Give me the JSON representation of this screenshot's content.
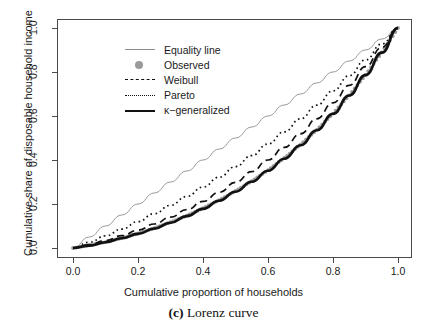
{
  "figure": {
    "caption_prefix": "(c)",
    "caption_text": "Lorenz curve"
  },
  "axes": {
    "x_title": "Cumulative proportion of households",
    "y_title": "Cumulative share of disposable household income",
    "x_ticks": [
      "0.0",
      "0.2",
      "0.4",
      "0.6",
      "0.8",
      "1.0"
    ],
    "y_ticks": [
      "0.0",
      "0.2",
      "0.4",
      "0.6",
      "0.8",
      "1.0"
    ]
  },
  "legend": {
    "items": [
      {
        "label": "Equality line",
        "key": "solid-thin-line",
        "color": "#8c8c8c"
      },
      {
        "label": "Observed",
        "key": "filled-circle-point",
        "color": "#9a9a9a"
      },
      {
        "label": "Weibull",
        "key": "dashed-line",
        "color": "#111111"
      },
      {
        "label": "Pareto",
        "key": "dotted-line",
        "color": "#111111"
      },
      {
        "label": "κ−generalized",
        "key": "solid-thick-line",
        "color": "#111111"
      }
    ]
  },
  "chart_data": {
    "type": "line",
    "title": "",
    "xlabel": "Cumulative proportion of households",
    "ylabel": "Cumulative share of disposable household income",
    "xlim": [
      0.0,
      1.0
    ],
    "ylim": [
      0.0,
      1.0
    ],
    "xticks": [
      0.0,
      0.2,
      0.4,
      0.6,
      0.8,
      1.0
    ],
    "yticks": [
      0.0,
      0.2,
      0.4,
      0.6,
      0.8,
      1.0
    ],
    "grid": false,
    "legend_position": "top-left",
    "x": [
      0.0,
      0.05,
      0.1,
      0.15,
      0.2,
      0.25,
      0.3,
      0.35,
      0.4,
      0.45,
      0.5,
      0.55,
      0.6,
      0.65,
      0.7,
      0.75,
      0.8,
      0.85,
      0.9,
      0.95,
      1.0
    ],
    "series": [
      {
        "name": "Equality line",
        "style": "solid-thin",
        "color": "#8c8c8c",
        "values": [
          0.0,
          0.05,
          0.1,
          0.15,
          0.2,
          0.25,
          0.3,
          0.35,
          0.4,
          0.45,
          0.5,
          0.55,
          0.6,
          0.65,
          0.7,
          0.75,
          0.8,
          0.85,
          0.9,
          0.95,
          1.0
        ]
      },
      {
        "name": "Observed",
        "style": "points",
        "color": "#9a9a9a",
        "values": [
          0.0,
          0.012,
          0.027,
          0.045,
          0.066,
          0.09,
          0.117,
          0.147,
          0.181,
          0.218,
          0.259,
          0.304,
          0.354,
          0.409,
          0.47,
          0.537,
          0.611,
          0.694,
          0.787,
          0.889,
          1.0
        ]
      },
      {
        "name": "Weibull",
        "style": "dashed",
        "color": "#111111",
        "values": [
          0.0,
          0.015,
          0.034,
          0.056,
          0.081,
          0.109,
          0.14,
          0.174,
          0.212,
          0.253,
          0.298,
          0.347,
          0.4,
          0.457,
          0.519,
          0.587,
          0.66,
          0.739,
          0.824,
          0.912,
          1.0
        ]
      },
      {
        "name": "Pareto",
        "style": "dotted",
        "color": "#111111",
        "values": [
          0.0,
          0.026,
          0.055,
          0.086,
          0.12,
          0.156,
          0.194,
          0.234,
          0.277,
          0.322,
          0.37,
          0.42,
          0.473,
          0.528,
          0.587,
          0.649,
          0.714,
          0.783,
          0.855,
          0.927,
          1.0
        ]
      },
      {
        "name": "κ−generalized",
        "style": "solid-thick",
        "color": "#111111",
        "values": [
          0.0,
          0.011,
          0.026,
          0.044,
          0.064,
          0.088,
          0.115,
          0.145,
          0.178,
          0.215,
          0.256,
          0.301,
          0.351,
          0.406,
          0.467,
          0.535,
          0.61,
          0.693,
          0.786,
          0.888,
          1.0
        ]
      }
    ]
  }
}
